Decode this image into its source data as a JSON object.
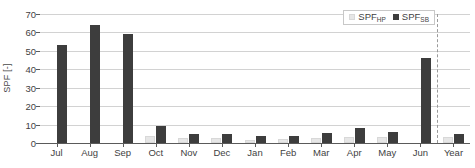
{
  "chart_data": {
    "type": "bar",
    "title": "",
    "xlabel": "",
    "ylabel": "SPF [-]",
    "ylim": [
      0,
      70
    ],
    "yticks": [
      0,
      10,
      20,
      30,
      40,
      50,
      60,
      70
    ],
    "grid": true,
    "legend_position": "top-right",
    "categories": [
      "Jul",
      "Aug",
      "Sep",
      "Oct",
      "Nov",
      "Dec",
      "Jan",
      "Feb",
      "Mar",
      "Apr",
      "May",
      "Jun",
      "Year"
    ],
    "series": [
      {
        "name": "SPF_HP",
        "label_base": "SPF",
        "label_sub": "HP",
        "color": "#e6e6e6",
        "values": [
          0,
          0,
          0,
          4.0,
          2.5,
          2.6,
          1.8,
          2.2,
          2.8,
          3.0,
          3.1,
          0,
          3.0
        ]
      },
      {
        "name": "SPF_SB",
        "label_base": "SPF",
        "label_sub": "SB",
        "color": "#3d3d3d",
        "values": [
          53,
          64,
          59,
          9.0,
          5.0,
          5.0,
          3.6,
          4.0,
          5.5,
          8.3,
          6.2,
          46,
          5.1
        ]
      }
    ],
    "separator_after_category": "Jun"
  },
  "axes": {
    "y_title": "SPF [-]"
  },
  "colors": {
    "bar_hp": "#e6e6e6",
    "bar_sb": "#3d3d3d",
    "grid": "#d2d2d2",
    "axis": "#5a5a5a",
    "text": "#3f3f3f",
    "separator": "#9a9a9a"
  }
}
